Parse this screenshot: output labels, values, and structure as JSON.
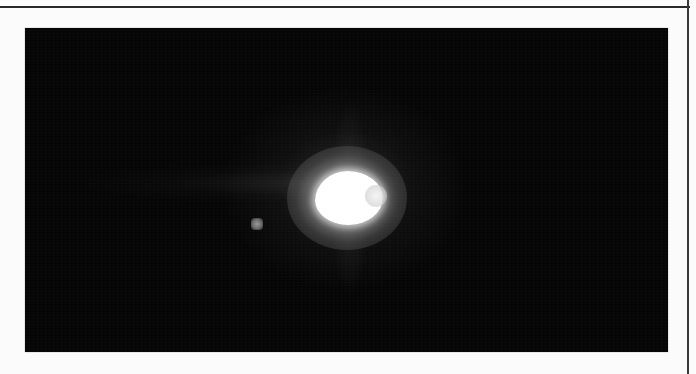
{
  "figure": {
    "background_color": "#050505",
    "page_color": "#fbfbfb",
    "rule_color": "#2a2a2a",
    "objects": [
      {
        "name": "primary-star",
        "color": "#ffffff",
        "shape": "saturated core with diffuse halo"
      },
      {
        "name": "companion-star",
        "color": "#8a8a8a",
        "shape": "faint point source left of primary"
      }
    ]
  }
}
